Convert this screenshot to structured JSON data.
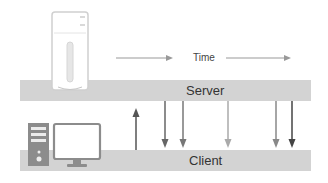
{
  "diagram": {
    "time_label": "Time",
    "server_label": "Server",
    "client_label": "Client",
    "colors": {
      "bar": "#d3d3d3",
      "arrow_dark": "#555555",
      "arrow_mid": "#777777",
      "arrow_light": "#aaaaaa",
      "icon_fill": "#ffffff",
      "icon_stroke": "#c8c8c8",
      "tower_fill": "#8c8c8c"
    },
    "arrows": [
      {
        "direction": "up",
        "x": 136,
        "shade": "dark"
      },
      {
        "direction": "down",
        "x": 165,
        "shade": "mid"
      },
      {
        "direction": "down",
        "x": 183,
        "shade": "mid"
      },
      {
        "direction": "down",
        "x": 228,
        "shade": "light"
      },
      {
        "direction": "down",
        "x": 276,
        "shade": "mid"
      },
      {
        "direction": "down",
        "x": 292,
        "shade": "dark"
      }
    ],
    "icons": [
      "server-tower-icon",
      "client-tower-icon",
      "monitor-icon"
    ]
  }
}
